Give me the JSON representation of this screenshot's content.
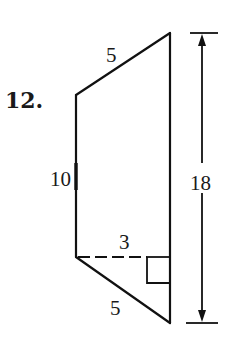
{
  "problem": {
    "number_label": "12."
  },
  "figure": {
    "shape": "trapezoid",
    "labels": {
      "top_slant_side": "5",
      "left_side": "10",
      "dashed_height": "3",
      "bottom_slant_side": "5",
      "overall_height": "18"
    },
    "markers": {
      "right_angle": "right-angle-marker",
      "dimension_arrow": "double-headed-arrow"
    },
    "colors": {
      "ink": "#111111",
      "background": "#ffffff"
    }
  }
}
